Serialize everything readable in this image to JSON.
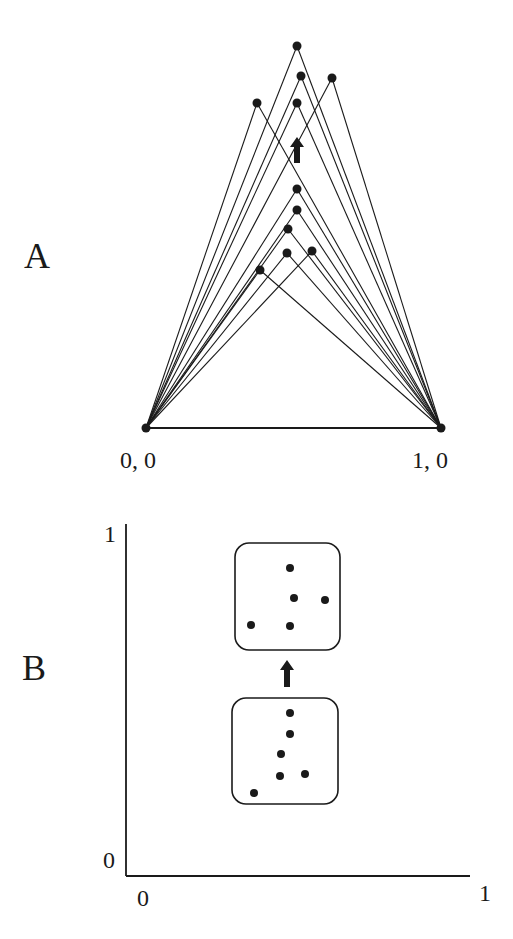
{
  "panels": {
    "A": {
      "label": "A",
      "base_left_label": "0, 0",
      "base_right_label": "1, 0",
      "base_left": [
        146,
        428
      ],
      "base_right": [
        441,
        428
      ],
      "points_after": [
        [
          297,
          46
        ],
        [
          301,
          76
        ],
        [
          332,
          78
        ],
        [
          257,
          103
        ],
        [
          297,
          103
        ]
      ],
      "points_before": [
        [
          297,
          189
        ],
        [
          297,
          210
        ],
        [
          288,
          229
        ],
        [
          287,
          253
        ],
        [
          312,
          251
        ],
        [
          260,
          270
        ]
      ],
      "arrow": {
        "x": 297,
        "y_top": 137,
        "y_bottom": 163,
        "direction": "up"
      }
    },
    "B": {
      "label": "B",
      "y_axis_top_label": "1",
      "y_axis_bottom_label": "0",
      "x_axis_left_label": "0",
      "x_axis_right_label": "1",
      "box_after": {
        "x": 235,
        "y": 543,
        "w": 105,
        "h": 107,
        "points": [
          [
            290,
            568
          ],
          [
            294,
            598
          ],
          [
            325,
            600
          ],
          [
            251,
            625
          ],
          [
            290,
            626
          ]
        ]
      },
      "box_before": {
        "x": 232,
        "y": 698,
        "w": 106,
        "h": 106,
        "points": [
          [
            290,
            713
          ],
          [
            290,
            734
          ],
          [
            281,
            754
          ],
          [
            280,
            776
          ],
          [
            305,
            774
          ],
          [
            254,
            793
          ]
        ]
      },
      "arrow": {
        "x": 287,
        "y_top": 660,
        "y_bottom": 687,
        "direction": "up"
      }
    }
  },
  "colors": {
    "ink": "#1a1a1a",
    "background": "#ffffff"
  },
  "chart_data": [
    {
      "type": "scatter",
      "title": "A",
      "description": "Triangles on base (0,0)-(1,0); apex points move upward (arrow) from lower set to upper set",
      "xlabel": "",
      "ylabel": "",
      "base_points": [
        {
          "label": "0, 0",
          "x": 0,
          "y": 0
        },
        {
          "label": "1, 0",
          "x": 1,
          "y": 0
        }
      ],
      "series": [
        {
          "name": "apexes before",
          "points": [
            [
              0.51,
              0.82
            ],
            [
              0.51,
              0.74
            ],
            [
              0.48,
              0.68
            ],
            [
              0.48,
              0.59
            ],
            [
              0.56,
              0.6
            ],
            [
              0.39,
              0.53
            ]
          ]
        },
        {
          "name": "apexes after",
          "points": [
            [
              0.51,
              1.34
            ],
            [
              0.53,
              1.23
            ],
            [
              0.63,
              1.22
            ],
            [
              0.38,
              1.14
            ],
            [
              0.51,
              1.14
            ]
          ]
        }
      ]
    },
    {
      "type": "scatter",
      "title": "B",
      "xlabel": "",
      "ylabel": "",
      "xlim": [
        0,
        1
      ],
      "ylim": [
        0,
        1
      ],
      "x_tick_labels": [
        "0",
        "1"
      ],
      "y_tick_labels": [
        "0",
        "1"
      ],
      "series": [
        {
          "name": "before (lower box)",
          "points": [
            [
              0.48,
              0.46
            ],
            [
              0.48,
              0.4
            ],
            [
              0.45,
              0.35
            ],
            [
              0.45,
              0.29
            ],
            [
              0.52,
              0.29
            ],
            [
              0.37,
              0.24
            ]
          ]
        },
        {
          "name": "after (upper box)",
          "points": [
            [
              0.48,
              0.88
            ],
            [
              0.49,
              0.79
            ],
            [
              0.58,
              0.79
            ],
            [
              0.36,
              0.71
            ],
            [
              0.48,
              0.71
            ]
          ]
        }
      ]
    }
  ]
}
